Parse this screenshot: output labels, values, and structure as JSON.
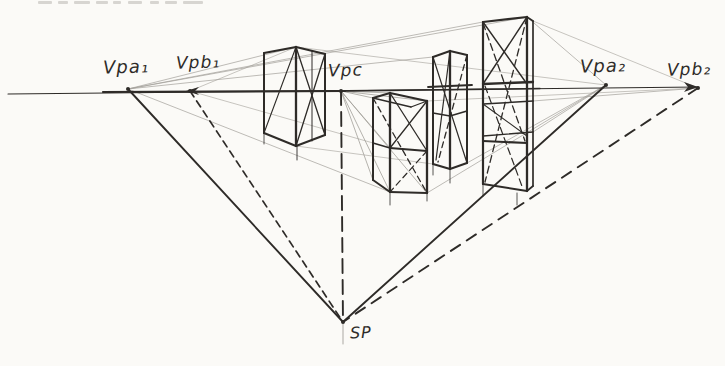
{
  "canvas": {
    "width": 725,
    "height": 366,
    "bg": "#fbfaf7",
    "ink": "#2e2b28",
    "faint": "#a29f99"
  },
  "labels": [
    {
      "id": "vpa1-label",
      "text": "Vpa₁",
      "x": 103,
      "y": 56,
      "size": 18
    },
    {
      "id": "vpb1-label",
      "text": "Vpb₁",
      "x": 176,
      "y": 52,
      "size": 17
    },
    {
      "id": "vpc-label",
      "text": "Vpc",
      "x": 328,
      "y": 60,
      "size": 17
    },
    {
      "id": "vpa2-label",
      "text": "Vpa₂",
      "x": 580,
      "y": 55,
      "size": 18
    },
    {
      "id": "vpb2-label",
      "text": "Vpb₂",
      "x": 667,
      "y": 59,
      "size": 17
    },
    {
      "id": "sp-label",
      "text": "SP",
      "x": 350,
      "y": 323,
      "size": 16
    }
  ],
  "points": [
    {
      "id": "vpa1",
      "x": 128,
      "y": 89
    },
    {
      "id": "vpb1",
      "x": 190,
      "y": 91
    },
    {
      "id": "vpc",
      "x": 341,
      "y": 91
    },
    {
      "id": "vpa2",
      "x": 606,
      "y": 85
    },
    {
      "id": "vpb2",
      "x": 698,
      "y": 88
    },
    {
      "id": "sp",
      "x": 343,
      "y": 322
    }
  ],
  "horizon": {
    "segments": [
      {
        "x1": 8,
        "y1": 94,
        "x2": 698,
        "y2": 87,
        "w": 1.1
      },
      {
        "x1": 103,
        "y1": 92,
        "x2": 345,
        "y2": 91,
        "w": 2.2
      },
      {
        "x1": 345,
        "y1": 91,
        "x2": 540,
        "y2": 88.5,
        "w": 1.5
      }
    ]
  },
  "construction_lines": [
    {
      "id": "line-vpa1-sp",
      "x1": 128,
      "y1": 89,
      "x2": 343,
      "y2": 322,
      "w": 1.9,
      "dash": null
    },
    {
      "id": "line-vpb1-sp",
      "x1": 190,
      "y1": 91,
      "x2": 343,
      "y2": 322,
      "w": 1.7,
      "dash": "7,5"
    },
    {
      "id": "line-vpc-sp",
      "x1": 341,
      "y1": 91,
      "x2": 343,
      "y2": 322,
      "w": 1.9,
      "dash": "14,7"
    },
    {
      "id": "line-vpa2-sp",
      "x1": 606,
      "y1": 85,
      "x2": 343,
      "y2": 322,
      "w": 1.9,
      "dash": null
    },
    {
      "id": "line-vpb2-sp",
      "x1": 698,
      "y1": 88,
      "x2": 343,
      "y2": 322,
      "w": 1.9,
      "dash": "11,8"
    },
    {
      "id": "sp-tick",
      "x1": 343,
      "y1": 322,
      "x2": 343,
      "y2": 344,
      "w": 0.9,
      "dash": null,
      "faint": true
    }
  ],
  "arrows": [
    {
      "id": "horizon-right-arrow",
      "points": "698,87 684,82 688,87 684,92"
    },
    {
      "id": "vpb1-left-arrow",
      "points": "186,91 199,87 195,91 199,95"
    }
  ],
  "dots": [
    {
      "x": 128,
      "y": 89
    },
    {
      "x": 190,
      "y": 91
    },
    {
      "x": 341,
      "y": 91
    },
    {
      "x": 606,
      "y": 85
    },
    {
      "x": 698,
      "y": 88
    },
    {
      "x": 343,
      "y": 322
    }
  ],
  "boxes": [
    {
      "id": "box-1",
      "segments": [
        {
          "x1": 264,
          "y1": 53,
          "x2": 264,
          "y2": 133,
          "w": 2
        },
        {
          "x1": 296,
          "y1": 47,
          "x2": 296,
          "y2": 146,
          "w": 2.3
        },
        {
          "x1": 325,
          "y1": 54,
          "x2": 325,
          "y2": 135,
          "w": 2
        },
        {
          "x1": 264,
          "y1": 53,
          "x2": 296,
          "y2": 47,
          "w": 2.1
        },
        {
          "x1": 296,
          "y1": 47,
          "x2": 325,
          "y2": 54,
          "w": 2.1
        },
        {
          "x1": 264,
          "y1": 133,
          "x2": 296,
          "y2": 146,
          "w": 2.1
        },
        {
          "x1": 296,
          "y1": 146,
          "x2": 325,
          "y2": 135,
          "w": 2.1
        },
        {
          "x1": 296,
          "y1": 47,
          "x2": 325,
          "y2": 135,
          "w": 1.3
        },
        {
          "x1": 325,
          "y1": 54,
          "x2": 296,
          "y2": 146,
          "w": 1.3
        },
        {
          "x1": 296,
          "y1": 47,
          "x2": 264,
          "y2": 133,
          "w": 1.1
        },
        {
          "x1": 312,
          "y1": 51,
          "x2": 312,
          "y2": 141,
          "w": 1
        },
        {
          "x1": 297,
          "y1": 146,
          "x2": 297,
          "y2": 160,
          "w": 0.9
        },
        {
          "x1": 264,
          "y1": 133,
          "x2": 264,
          "y2": 144,
          "w": 0.8
        }
      ]
    },
    {
      "id": "box-2",
      "segments": [
        {
          "x1": 373,
          "y1": 98,
          "x2": 373,
          "y2": 180,
          "w": 2
        },
        {
          "x1": 390,
          "y1": 93,
          "x2": 390,
          "y2": 192,
          "w": 2.3
        },
        {
          "x1": 427,
          "y1": 101,
          "x2": 427,
          "y2": 193,
          "w": 2.3
        },
        {
          "x1": 373,
          "y1": 98,
          "x2": 390,
          "y2": 93,
          "w": 2
        },
        {
          "x1": 390,
          "y1": 93,
          "x2": 427,
          "y2": 101,
          "w": 2.1
        },
        {
          "x1": 373,
          "y1": 98,
          "x2": 411,
          "y2": 107,
          "w": 1.3
        },
        {
          "x1": 411,
          "y1": 107,
          "x2": 427,
          "y2": 101,
          "w": 1.3
        },
        {
          "x1": 390,
          "y1": 148,
          "x2": 427,
          "y2": 151,
          "w": 2
        },
        {
          "x1": 373,
          "y1": 143,
          "x2": 390,
          "y2": 148,
          "w": 1.5
        },
        {
          "x1": 373,
          "y1": 180,
          "x2": 390,
          "y2": 192,
          "w": 2
        },
        {
          "x1": 390,
          "y1": 192,
          "x2": 427,
          "y2": 193,
          "w": 2
        },
        {
          "x1": 390,
          "y1": 93,
          "x2": 427,
          "y2": 151,
          "w": 1.3
        },
        {
          "x1": 427,
          "y1": 101,
          "x2": 390,
          "y2": 148,
          "w": 1.3
        },
        {
          "x1": 373,
          "y1": 98,
          "x2": 427,
          "y2": 193,
          "w": 1.3,
          "dash": "6,4"
        },
        {
          "x1": 427,
          "y1": 151,
          "x2": 390,
          "y2": 192,
          "w": 1.2,
          "dash": "6,4"
        },
        {
          "x1": 390,
          "y1": 192,
          "x2": 390,
          "y2": 205,
          "w": 0.8
        },
        {
          "x1": 427,
          "y1": 193,
          "x2": 427,
          "y2": 201,
          "w": 0.8
        }
      ]
    },
    {
      "id": "box-3",
      "segments": [
        {
          "x1": 433,
          "y1": 57,
          "x2": 433,
          "y2": 164,
          "w": 2
        },
        {
          "x1": 450,
          "y1": 51,
          "x2": 450,
          "y2": 169,
          "w": 2.3
        },
        {
          "x1": 467,
          "y1": 55,
          "x2": 467,
          "y2": 163,
          "w": 2
        },
        {
          "x1": 433,
          "y1": 57,
          "x2": 450,
          "y2": 51,
          "w": 2
        },
        {
          "x1": 450,
          "y1": 51,
          "x2": 467,
          "y2": 55,
          "w": 2
        },
        {
          "x1": 433,
          "y1": 164,
          "x2": 450,
          "y2": 169,
          "w": 2
        },
        {
          "x1": 450,
          "y1": 169,
          "x2": 467,
          "y2": 163,
          "w": 2
        },
        {
          "x1": 433,
          "y1": 113,
          "x2": 450,
          "y2": 116,
          "w": 1.6
        },
        {
          "x1": 450,
          "y1": 116,
          "x2": 467,
          "y2": 111,
          "w": 1.6
        },
        {
          "x1": 428,
          "y1": 87,
          "x2": 472,
          "y2": 85,
          "w": 1.8
        },
        {
          "x1": 433,
          "y1": 57,
          "x2": 467,
          "y2": 163,
          "w": 1.2
        },
        {
          "x1": 450,
          "y1": 51,
          "x2": 436,
          "y2": 160,
          "w": 1.2
        },
        {
          "x1": 467,
          "y1": 55,
          "x2": 438,
          "y2": 162,
          "w": 1.3,
          "dash": "6,4"
        },
        {
          "x1": 450,
          "y1": 169,
          "x2": 450,
          "y2": 183,
          "w": 0.8
        },
        {
          "x1": 433,
          "y1": 164,
          "x2": 433,
          "y2": 175,
          "w": 0.8
        }
      ]
    },
    {
      "id": "box-4",
      "segments": [
        {
          "x1": 483,
          "y1": 22,
          "x2": 483,
          "y2": 184,
          "w": 2.2
        },
        {
          "x1": 527,
          "y1": 17,
          "x2": 527,
          "y2": 191,
          "w": 2.3
        },
        {
          "x1": 533,
          "y1": 21,
          "x2": 533,
          "y2": 186,
          "w": 1.7
        },
        {
          "x1": 483,
          "y1": 22,
          "x2": 527,
          "y2": 17,
          "w": 2.2
        },
        {
          "x1": 527,
          "y1": 17,
          "x2": 533,
          "y2": 21,
          "w": 1.7
        },
        {
          "x1": 483,
          "y1": 84,
          "x2": 533,
          "y2": 82,
          "w": 2.3
        },
        {
          "x1": 483,
          "y1": 104,
          "x2": 533,
          "y2": 101,
          "w": 1.5
        },
        {
          "x1": 483,
          "y1": 136,
          "x2": 533,
          "y2": 132,
          "w": 1.4
        },
        {
          "x1": 483,
          "y1": 141,
          "x2": 527,
          "y2": 143,
          "w": 2.2
        },
        {
          "x1": 483,
          "y1": 184,
          "x2": 527,
          "y2": 191,
          "w": 2.1
        },
        {
          "x1": 527,
          "y1": 191,
          "x2": 533,
          "y2": 186,
          "w": 1.7
        },
        {
          "x1": 483,
          "y1": 22,
          "x2": 527,
          "y2": 84,
          "w": 1.4
        },
        {
          "x1": 527,
          "y1": 17,
          "x2": 483,
          "y2": 84,
          "w": 1.4
        },
        {
          "x1": 483,
          "y1": 104,
          "x2": 527,
          "y2": 136,
          "w": 1.1
        },
        {
          "x1": 527,
          "y1": 17,
          "x2": 485,
          "y2": 182,
          "w": 1.3,
          "dash": "7,4"
        },
        {
          "x1": 483,
          "y1": 23,
          "x2": 525,
          "y2": 141,
          "w": 1.3,
          "dash": "7,4"
        },
        {
          "x1": 485,
          "y1": 86,
          "x2": 523,
          "y2": 189,
          "w": 1.2,
          "dash": "7,4"
        },
        {
          "x1": 517,
          "y1": 193,
          "x2": 517,
          "y2": 205,
          "w": 0.8
        },
        {
          "x1": 483,
          "y1": 184,
          "x2": 483,
          "y2": 196,
          "w": 0.8
        }
      ]
    }
  ],
  "guides": [
    {
      "x1": 128,
      "y1": 89,
      "x2": 296,
      "y2": 47,
      "w": 0.7
    },
    {
      "x1": 128,
      "y1": 89,
      "x2": 433,
      "y2": 57,
      "w": 0.7
    },
    {
      "x1": 128,
      "y1": 89,
      "x2": 483,
      "y2": 22,
      "w": 0.7
    },
    {
      "x1": 128,
      "y1": 89,
      "x2": 527,
      "y2": 17,
      "w": 0.7
    },
    {
      "x1": 128,
      "y1": 89,
      "x2": 390,
      "y2": 192,
      "w": 0.7
    },
    {
      "x1": 190,
      "y1": 91,
      "x2": 296,
      "y2": 47,
      "w": 0.6
    },
    {
      "x1": 190,
      "y1": 91,
      "x2": 373,
      "y2": 143,
      "w": 0.6
    },
    {
      "x1": 341,
      "y1": 91,
      "x2": 373,
      "y2": 98,
      "w": 0.8
    },
    {
      "x1": 341,
      "y1": 91,
      "x2": 390,
      "y2": 93,
      "w": 0.8
    },
    {
      "x1": 341,
      "y1": 91,
      "x2": 427,
      "y2": 101,
      "w": 0.8
    },
    {
      "x1": 341,
      "y1": 91,
      "x2": 390,
      "y2": 148,
      "w": 0.8
    },
    {
      "x1": 341,
      "y1": 91,
      "x2": 373,
      "y2": 180,
      "w": 0.8
    },
    {
      "x1": 341,
      "y1": 91,
      "x2": 390,
      "y2": 192,
      "w": 0.8
    },
    {
      "x1": 341,
      "y1": 91,
      "x2": 427,
      "y2": 193,
      "w": 0.8
    },
    {
      "x1": 606,
      "y1": 85,
      "x2": 427,
      "y2": 193,
      "w": 0.7
    },
    {
      "x1": 606,
      "y1": 85,
      "x2": 467,
      "y2": 163,
      "w": 0.7
    },
    {
      "x1": 606,
      "y1": 85,
      "x2": 533,
      "y2": 132,
      "w": 0.7
    },
    {
      "x1": 606,
      "y1": 85,
      "x2": 527,
      "y2": 17,
      "w": 0.7
    },
    {
      "x1": 698,
      "y1": 88,
      "x2": 533,
      "y2": 101,
      "w": 0.7
    },
    {
      "x1": 698,
      "y1": 88,
      "x2": 427,
      "y2": 101,
      "w": 0.6
    },
    {
      "x1": 698,
      "y1": 88,
      "x2": 533,
      "y2": 21,
      "w": 0.6
    },
    {
      "x1": 296,
      "y1": 47,
      "x2": 606,
      "y2": 85,
      "w": 0.6
    },
    {
      "x1": 296,
      "y1": 146,
      "x2": 433,
      "y2": 164,
      "w": 0.6
    }
  ],
  "artifact_marks": [
    {
      "x": 38,
      "w": 14
    },
    {
      "x": 58,
      "w": 10
    },
    {
      "x": 74,
      "w": 16
    },
    {
      "x": 96,
      "w": 12
    },
    {
      "x": 113,
      "w": 8
    },
    {
      "x": 128,
      "w": 14
    },
    {
      "x": 150,
      "w": 9
    },
    {
      "x": 165,
      "w": 12
    },
    {
      "x": 183,
      "w": 20
    }
  ]
}
